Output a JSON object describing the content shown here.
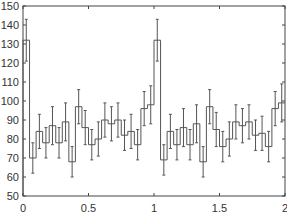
{
  "chart_data": {
    "type": "bar",
    "subtype": "step-histogram-with-error-bars",
    "title": "",
    "xlabel": "",
    "ylabel": "",
    "xlim": [
      0,
      2
    ],
    "ylim": [
      50,
      150
    ],
    "grid": false,
    "legend": null,
    "x_ticks": [
      0,
      0.5,
      1,
      1.5,
      2
    ],
    "x_tick_labels": [
      "0",
      "0.5",
      "1",
      "1.5",
      "2"
    ],
    "y_ticks": [
      50,
      60,
      70,
      80,
      90,
      100,
      110,
      120,
      130,
      140,
      150
    ],
    "y_tick_labels": [
      "50",
      "60",
      "70",
      "80",
      "90",
      "100",
      "110",
      "120",
      "130",
      "140",
      "150"
    ],
    "bin_width": 0.05,
    "bin_starts": [
      0,
      0.05,
      0.1,
      0.15,
      0.2,
      0.25,
      0.3,
      0.35,
      0.4,
      0.45,
      0.5,
      0.55,
      0.6,
      0.65,
      0.7,
      0.75,
      0.8,
      0.85,
      0.9,
      0.95,
      1,
      1.05,
      1.1,
      1.15,
      1.2,
      1.25,
      1.3,
      1.35,
      1.4,
      1.45,
      1.5,
      1.55,
      1.6,
      1.65,
      1.7,
      1.75,
      1.8,
      1.85,
      1.9,
      1.95
    ],
    "values": [
      132,
      70,
      84,
      78,
      87,
      78,
      89,
      68,
      97,
      86,
      77,
      80,
      90,
      88,
      90,
      82,
      84,
      77,
      96,
      98,
      132,
      69,
      84,
      77,
      86,
      77,
      88,
      68,
      97,
      85,
      76,
      80,
      89,
      87,
      89,
      82,
      83,
      76,
      96,
      99
    ],
    "errors": [
      11,
      8,
      9,
      8,
      10,
      8,
      10,
      8,
      9,
      9,
      8,
      9,
      9,
      9,
      9,
      8,
      9,
      8,
      9,
      10,
      11,
      8,
      9,
      8,
      10,
      8,
      10,
      8,
      9,
      9,
      8,
      9,
      9,
      9,
      9,
      8,
      9,
      8,
      9,
      10
    ],
    "line_color": "#555555"
  }
}
